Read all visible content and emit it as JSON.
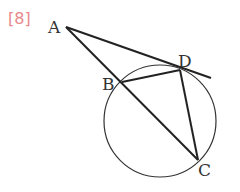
{
  "problem_number": "[8]",
  "colors": {
    "number": "#e8898c",
    "lines": "#222222",
    "labels": "#333333"
  },
  "points": {
    "A": {
      "label": "A",
      "x": 66,
      "y": 27
    },
    "B": {
      "label": "B",
      "x": 122,
      "y": 82
    },
    "C": {
      "label": "C",
      "x": 198,
      "y": 160
    },
    "D": {
      "label": "D",
      "x": 180,
      "y": 70
    }
  },
  "circle": {
    "cx": 160,
    "cy": 121,
    "r": 56
  },
  "segments": [
    "AC",
    "AD (tangent, extended)",
    "BD",
    "DC"
  ]
}
